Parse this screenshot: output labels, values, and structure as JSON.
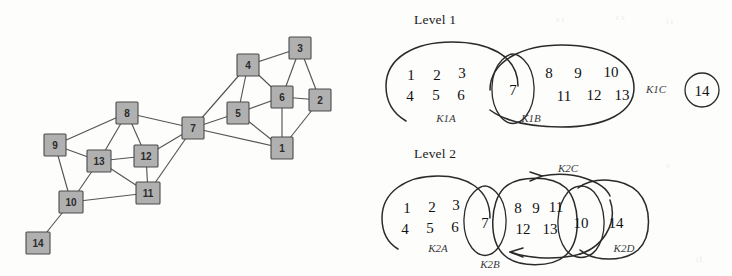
{
  "figure": {
    "background_color": "#fdfdfc",
    "ink_color": "#2a2a2a",
    "node_fill_color": "#b0b0b0",
    "node_stroke_color": "#4a4a4a"
  },
  "graph": {
    "title": "",
    "node_count": 14,
    "nodes": [
      {
        "id": "1",
        "label": "1",
        "x": 282,
        "y": 148
      },
      {
        "id": "2",
        "label": "2",
        "x": 320,
        "y": 100
      },
      {
        "id": "3",
        "label": "3",
        "x": 300,
        "y": 48
      },
      {
        "id": "4",
        "label": "4",
        "x": 248,
        "y": 65
      },
      {
        "id": "5",
        "label": "5",
        "x": 238,
        "y": 113
      },
      {
        "id": "6",
        "label": "6",
        "x": 282,
        "y": 97
      },
      {
        "id": "7",
        "label": "7",
        "x": 193,
        "y": 128
      },
      {
        "id": "8",
        "label": "8",
        "x": 127,
        "y": 113
      },
      {
        "id": "9",
        "label": "9",
        "x": 55,
        "y": 145
      },
      {
        "id": "10",
        "label": "10",
        "x": 71,
        "y": 202
      },
      {
        "id": "11",
        "label": "11",
        "x": 148,
        "y": 193
      },
      {
        "id": "12",
        "label": "12",
        "x": 146,
        "y": 156
      },
      {
        "id": "13",
        "label": "13",
        "x": 99,
        "y": 161
      },
      {
        "id": "14",
        "label": "14",
        "x": 38,
        "y": 243
      }
    ],
    "edges": [
      [
        "3",
        "4"
      ],
      [
        "3",
        "6"
      ],
      [
        "3",
        "2"
      ],
      [
        "4",
        "5"
      ],
      [
        "4",
        "6"
      ],
      [
        "4",
        "7"
      ],
      [
        "6",
        "2"
      ],
      [
        "6",
        "5"
      ],
      [
        "6",
        "1"
      ],
      [
        "2",
        "1"
      ],
      [
        "5",
        "1"
      ],
      [
        "5",
        "7"
      ],
      [
        "1",
        "7"
      ],
      [
        "7",
        "8"
      ],
      [
        "7",
        "12"
      ],
      [
        "7",
        "11"
      ],
      [
        "8",
        "9"
      ],
      [
        "8",
        "13"
      ],
      [
        "8",
        "12"
      ],
      [
        "9",
        "13"
      ],
      [
        "9",
        "10"
      ],
      [
        "13",
        "12"
      ],
      [
        "13",
        "11"
      ],
      [
        "13",
        "10"
      ],
      [
        "12",
        "11"
      ],
      [
        "11",
        "10"
      ],
      [
        "10",
        "14"
      ]
    ]
  },
  "levels": [
    {
      "id": "level-1",
      "title": "Level 1",
      "clusters": [
        {
          "id": "K1A",
          "label": "K1A",
          "members": [
            "1",
            "2",
            "3",
            "4",
            "5",
            "6"
          ]
        },
        {
          "id": "K1B",
          "label": "K1B",
          "members": [
            "7",
            "8",
            "9",
            "10",
            "11",
            "12",
            "13"
          ]
        },
        {
          "id": "K1C",
          "label": "K1C",
          "members": [
            "14"
          ]
        }
      ],
      "shared_members": [
        "7"
      ],
      "rows": {
        "K1A_row1": [
          "1",
          "2",
          "3"
        ],
        "K1A_row2": [
          "4",
          "5",
          "6"
        ],
        "lens": [
          "7"
        ],
        "K1B_row1": [
          "8",
          "9",
          "10"
        ],
        "K1B_row2": [
          "11",
          "12",
          "13"
        ],
        "K1C_row": [
          "14"
        ]
      }
    },
    {
      "id": "level-2",
      "title": "Level 2",
      "clusters": [
        {
          "id": "K2A",
          "label": "K2A",
          "members": [
            "1",
            "2",
            "3",
            "4",
            "5",
            "6"
          ]
        },
        {
          "id": "K2B",
          "label": "K2B",
          "members": [
            "7",
            "8",
            "9",
            "11",
            "12",
            "13"
          ]
        },
        {
          "id": "K2C",
          "label": "K2C",
          "members": [
            "8",
            "9",
            "11",
            "12",
            "13",
            "10"
          ]
        },
        {
          "id": "K2D",
          "label": "K2D",
          "members": [
            "10",
            "14"
          ]
        }
      ],
      "shared_members": [
        "7",
        "10"
      ],
      "rows": {
        "K2A_row1": [
          "1",
          "2",
          "3"
        ],
        "K2A_row2": [
          "4",
          "5",
          "6"
        ],
        "lensB": [
          "7"
        ],
        "K2C_row1": [
          "8",
          "9",
          "11"
        ],
        "K2C_row2": [
          "12",
          "13"
        ],
        "lensC": [
          "10"
        ],
        "K2D_row": [
          "14"
        ]
      }
    }
  ]
}
